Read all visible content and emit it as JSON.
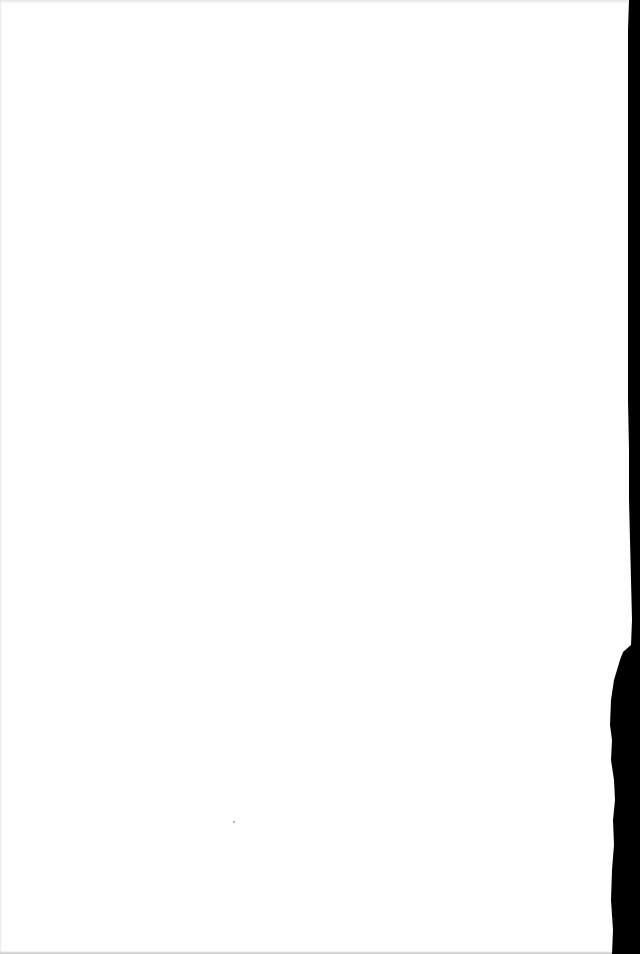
{
  "document": {
    "type": "blank scanned page",
    "text_content": "",
    "background_color": "#fefefe",
    "scan_edge_color": "#000000"
  }
}
